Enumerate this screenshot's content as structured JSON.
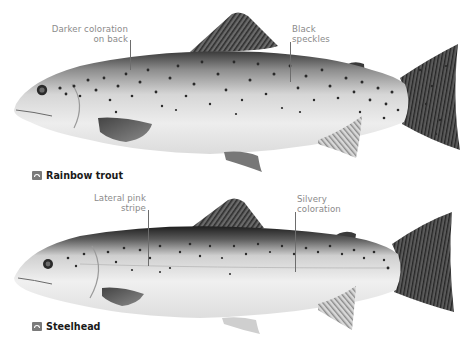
{
  "figure": {
    "fish": [
      {
        "name": "Rainbow trout",
        "icon": "expand-collapse-icon",
        "callouts": [
          {
            "text_line1": "Darker coloration",
            "text_line2": "on back"
          },
          {
            "text_line1": "Black",
            "text_line2": "speckles"
          }
        ]
      },
      {
        "name": "Steelhead",
        "icon": "expand-collapse-icon",
        "callouts": [
          {
            "text_line1": "Lateral pink",
            "text_line2": "stripe"
          },
          {
            "text_line1": "Silvery",
            "text_line2": "coloration"
          }
        ]
      }
    ]
  },
  "colors": {
    "background": "#ffffff",
    "callout_text": "#8a8a8a",
    "label_text": "#1a1a1a",
    "icon_bg": "#7a7a7a",
    "fish_back": "#2b2b2b",
    "fish_belly": "#f2f2f2"
  }
}
